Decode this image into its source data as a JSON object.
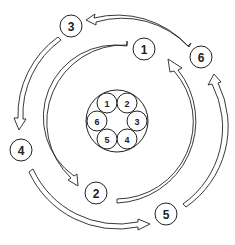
{
  "diagram": {
    "type": "cyclic-flow",
    "center": {
      "hub_labels": [
        "1",
        "2",
        "3",
        "4",
        "5",
        "6"
      ]
    },
    "nodes": [
      {
        "id": "node-1",
        "label": "1"
      },
      {
        "id": "node-2",
        "label": "2"
      },
      {
        "id": "node-3",
        "label": "3"
      },
      {
        "id": "node-4",
        "label": "4"
      },
      {
        "id": "node-5",
        "label": "5"
      },
      {
        "id": "node-6",
        "label": "6"
      }
    ],
    "edges": [
      {
        "from": "1",
        "to": "2",
        "ring": "inner",
        "direction": "counter-clockwise"
      },
      {
        "from": "2",
        "to": "1",
        "ring": "inner",
        "direction": "counter-clockwise"
      },
      {
        "from": "6",
        "to": "3",
        "ring": "outer",
        "direction": "counter-clockwise"
      },
      {
        "from": "3",
        "to": "4",
        "ring": "outer",
        "direction": "counter-clockwise"
      },
      {
        "from": "4",
        "to": "5",
        "ring": "outer",
        "direction": "counter-clockwise"
      },
      {
        "from": "5",
        "to": "6",
        "ring": "outer",
        "direction": "counter-clockwise"
      }
    ],
    "colors": {
      "line": "#222222",
      "fill": "#ffffff"
    }
  }
}
